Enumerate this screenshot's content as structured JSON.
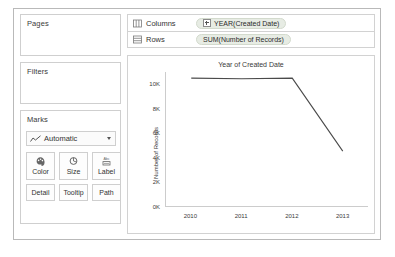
{
  "panels": {
    "pages": {
      "title": "Pages"
    },
    "filters": {
      "title": "Filters"
    },
    "marks": {
      "title": "Marks",
      "type_selected": "Automatic",
      "type_icon": "line-chart-icon",
      "dropdown_icon": "chevron-down-icon",
      "buttons": [
        {
          "label": "Color",
          "icon": "color-palette-icon"
        },
        {
          "label": "Size",
          "icon": "size-circle-icon"
        },
        {
          "label": "Label",
          "icon": "label-abc-icon"
        },
        {
          "label": "Detail",
          "icon": "detail-icon"
        },
        {
          "label": "Tooltip",
          "icon": "tooltip-icon"
        },
        {
          "label": "Path",
          "icon": "path-icon"
        }
      ]
    }
  },
  "shelves": {
    "columns": {
      "name": "Columns",
      "icon": "columns-icon",
      "pill": {
        "label": "YEAR(Created Date)",
        "expander": "plus-icon"
      }
    },
    "rows": {
      "name": "Rows",
      "icon": "rows-icon",
      "pill": {
        "label": "SUM(Number of Records)"
      }
    }
  },
  "colors": {
    "line": "#4a4a4a",
    "pill_bg": "#e7ece4",
    "panel_border": "#cfcfcf",
    "axis": "#cccccc"
  },
  "chart_data": {
    "type": "line",
    "title": "Year of Created Date",
    "xlabel": "",
    "ylabel": "Number of Records",
    "x": [
      "2010",
      "2011",
      "2012",
      "2013"
    ],
    "categories": [
      "2010",
      "2011",
      "2012",
      "2013"
    ],
    "values": [
      10500,
      10450,
      10500,
      4500
    ],
    "series": [
      {
        "name": "SUM(Number of Records)",
        "values": [
          10500,
          10450,
          10500,
          4500
        ]
      }
    ],
    "ylim": [
      0,
      11000
    ],
    "yticks": [
      0,
      2000,
      4000,
      6000,
      8000,
      10000
    ],
    "ytick_labels": [
      "0K",
      "2K",
      "4K",
      "6K",
      "8K",
      "10K"
    ],
    "xtick_labels": [
      "2010",
      "2011",
      "2012",
      "2013"
    ],
    "grid": false,
    "legend": "none"
  }
}
